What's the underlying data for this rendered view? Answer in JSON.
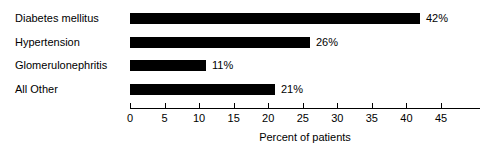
{
  "chart_data": {
    "type": "bar",
    "orientation": "horizontal",
    "title": "",
    "xlabel": "Percent of patients",
    "ylabel": "",
    "categories": [
      "Diabetes mellitus",
      "Hypertension",
      "Glomerulonephritis",
      "All Other"
    ],
    "values": [
      42,
      26,
      11,
      21
    ],
    "value_labels": [
      "42%",
      "26%",
      "11%",
      "21%"
    ],
    "xlim": [
      0,
      45
    ],
    "xticks": [
      0,
      5,
      10,
      15,
      20,
      25,
      30,
      35,
      40,
      45
    ],
    "xtick_labels": [
      "0",
      "5",
      "10",
      "15",
      "20",
      "25",
      "30",
      "35",
      "40",
      "45"
    ],
    "grid": false,
    "legend": null,
    "bar_color": "#000000",
    "background_color": "#ffffff",
    "axis_color": "#000000",
    "text_color": "#000000"
  }
}
